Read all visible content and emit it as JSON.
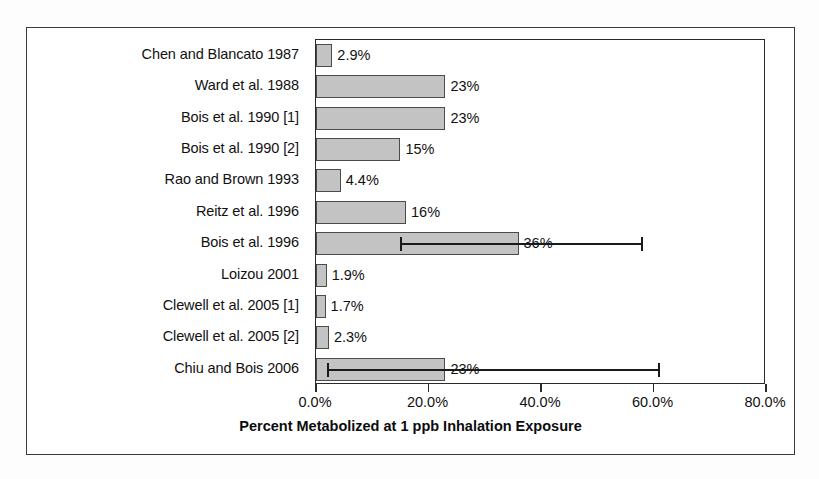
{
  "chart_data": {
    "type": "bar",
    "orientation": "horizontal",
    "title": "",
    "xlabel": "Percent Metabolized at 1 ppb Inhalation Exposure",
    "ylabel": "",
    "xlim": [
      0,
      80
    ],
    "xticks": [
      0,
      20,
      40,
      60,
      80
    ],
    "xtick_labels": [
      "0.0%",
      "20.0%",
      "40.0%",
      "60.0%",
      "80.0%"
    ],
    "grid": false,
    "legend": null,
    "categories": [
      "Chen and Blancato 1987",
      "Ward et al. 1988",
      "Bois et al. 1990 [1]",
      "Bois et al. 1990 [2]",
      "Rao and Brown 1993",
      "Reitz et al. 1996",
      "Bois et al. 1996",
      "Loizou 2001",
      "Clewell et al. 2005 [1]",
      "Clewell et al. 2005 [2]",
      "Chiu and Bois 2006"
    ],
    "values": [
      2.9,
      23,
      23,
      15,
      4.4,
      16,
      36,
      1.9,
      1.7,
      2.3,
      23
    ],
    "value_labels": [
      "2.9%",
      "23%",
      "23%",
      "15%",
      "4.4%",
      "16%",
      "36%",
      "1.9%",
      "1.7%",
      "2.3%",
      "23%"
    ],
    "error_bars": [
      null,
      null,
      null,
      null,
      null,
      null,
      {
        "low": 15,
        "high": 58
      },
      null,
      null,
      null,
      {
        "low": 2,
        "high": 61
      }
    ],
    "bar_color": "#c3c3c3",
    "bar_edge_color": "#4b4b4b",
    "axis_color": "#2b2b2b"
  }
}
